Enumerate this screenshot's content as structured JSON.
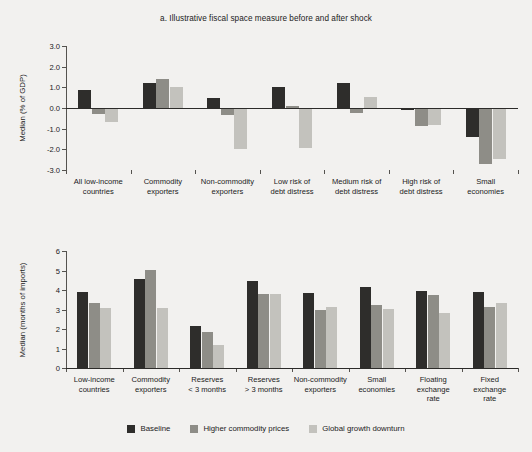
{
  "figure": {
    "background": "#f2f1ef",
    "series_colors": [
      "#2e2d2b",
      "#8e8d87",
      "#c3c2bd"
    ]
  },
  "legend": {
    "items": [
      {
        "label": "Baseline",
        "color": "#2e2d2b"
      },
      {
        "label": "Higher commodity prices",
        "color": "#8e8d87"
      },
      {
        "label": "Global growth downturn",
        "color": "#c3c2bd"
      }
    ]
  },
  "chart_data": [
    {
      "type": "bar",
      "panel": "a",
      "title": "a.  Illustrative fiscal space measure before and after shock",
      "xlabel": "",
      "ylabel": "Median (% of GDP)",
      "ylim": [
        -3.0,
        3.0
      ],
      "yticks": [
        3.0,
        2.0,
        1.0,
        0.0,
        -1.0,
        -2.0,
        -3.0
      ],
      "ytick_labels": [
        "3.0",
        "2.0",
        "1.0",
        "0.0",
        "-1.0",
        "-2.0",
        "-3.0"
      ],
      "grid": false,
      "legend_position": "bottom",
      "categories": [
        "All low-income countries",
        "Commodity exporters",
        "Non-commodity exporters",
        "Low risk of debt distress",
        "Medium risk of debt distress",
        "High risk of debt distress",
        "Small economies"
      ],
      "series": [
        {
          "name": "Baseline",
          "values": [
            0.88,
            1.2,
            0.5,
            1.0,
            1.2,
            -0.1,
            -1.4
          ]
        },
        {
          "name": "Higher commodity prices",
          "values": [
            -0.3,
            1.38,
            -0.35,
            0.1,
            -0.25,
            -0.85,
            -2.7
          ]
        },
        {
          "name": "Global growth downturn",
          "values": [
            -0.68,
            1.03,
            -2.0,
            -1.95,
            0.53,
            -0.8,
            -2.45
          ]
        }
      ]
    },
    {
      "type": "bar",
      "panel": "b",
      "title": "b.  Reserve coverage",
      "xlabel": "",
      "ylabel": "Median (months of imports)",
      "ylim": [
        0,
        6
      ],
      "yticks": [
        6,
        5,
        4,
        3,
        2,
        1,
        0
      ],
      "ytick_labels": [
        "6",
        "5",
        "4",
        "3",
        "2",
        "1",
        "0"
      ],
      "grid": false,
      "legend_position": "bottom",
      "categories": [
        "Low-income countries",
        "Commodity exporters",
        "Reserves < 3 months",
        "Reserves > 3 months",
        "Non-commodity exporters",
        "Small economies",
        "Floating exchange rate",
        "Fixed exchange rate"
      ],
      "series": [
        {
          "name": "Baseline",
          "values": [
            3.9,
            4.55,
            2.17,
            4.48,
            3.86,
            4.15,
            3.94,
            3.89
          ]
        },
        {
          "name": "Higher commodity prices",
          "values": [
            3.32,
            5.02,
            1.86,
            3.8,
            2.98,
            3.22,
            3.76,
            3.15
          ]
        },
        {
          "name": "Global growth downturn",
          "values": [
            3.08,
            3.08,
            1.16,
            3.8,
            3.11,
            3.02,
            2.8,
            3.33
          ]
        }
      ]
    }
  ],
  "panel_a_xlabels": [
    [
      "All low-income",
      "countries"
    ],
    [
      "Commodity",
      "exporters"
    ],
    [
      "Non-commodity",
      "exporters"
    ],
    [
      "Low risk of",
      "debt distress"
    ],
    [
      "Medium risk of",
      "debt distress"
    ],
    [
      "High risk of",
      "debt distress"
    ],
    [
      "Small",
      "economies"
    ]
  ],
  "panel_b_xlabels": [
    [
      "Low-income",
      "countries"
    ],
    [
      "Commodity",
      "exporters"
    ],
    [
      "Reserves",
      "< 3 months"
    ],
    [
      "Reserves",
      "> 3 months"
    ],
    [
      "Non-commodity",
      "exporters"
    ],
    [
      "Small",
      "economies"
    ],
    [
      "Floating",
      "exchange",
      "rate"
    ],
    [
      "Fixed",
      "exchange",
      "rate"
    ]
  ]
}
